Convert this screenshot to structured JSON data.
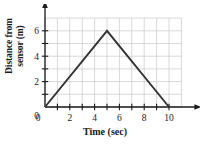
{
  "chart_data": {
    "type": "line",
    "title": "",
    "xlabel": "Time (sec)",
    "ylabel_line1": "Distance from",
    "ylabel_line2": "sensor (m)",
    "x_axis_variable": "x",
    "y_axis_variable": "y",
    "xlim": [
      0,
      11
    ],
    "ylim": [
      0,
      7
    ],
    "grid": true,
    "grid_spacing_x": 1,
    "grid_spacing_y": 1,
    "grid_color": "#c8c8c8",
    "axis_color": "#1a1a1a",
    "line_color": "#333333",
    "legend": null,
    "x_tick_values": [
      0,
      1,
      2,
      3,
      4,
      5,
      6,
      7,
      8,
      9,
      10
    ],
    "x_tick_labels": [
      "0",
      "",
      "2",
      "",
      "4",
      "",
      "6",
      "",
      "8",
      "",
      "10"
    ],
    "y_tick_values": [
      0,
      1,
      2,
      3,
      4,
      5,
      6
    ],
    "y_tick_labels": [
      "0",
      "",
      "2",
      "",
      "4",
      "",
      "6"
    ],
    "series": [
      {
        "name": "distance",
        "points": [
          {
            "x": 0,
            "y": 0
          },
          {
            "x": 5,
            "y": 6
          },
          {
            "x": 10,
            "y": 0
          }
        ]
      }
    ]
  }
}
